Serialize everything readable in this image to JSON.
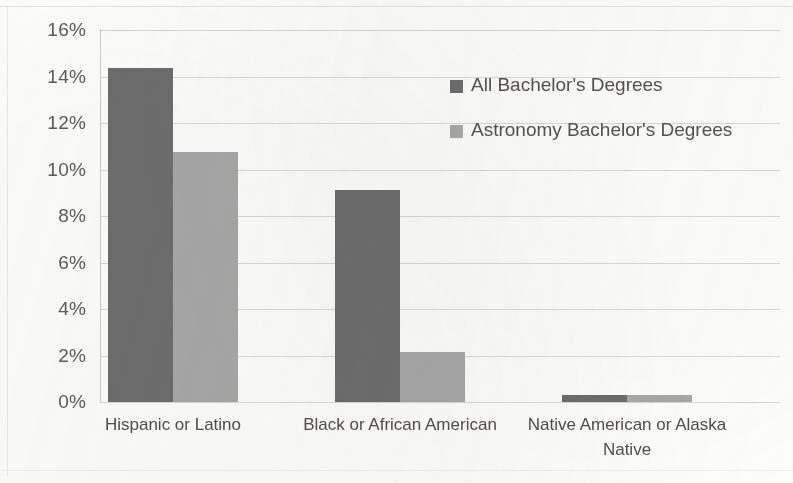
{
  "chart_data": {
    "type": "bar",
    "title": "",
    "subtitle": "",
    "xlabel": "",
    "ylabel": "",
    "categories": [
      "Hispanic or Latino",
      "Black or African American",
      "Native American or Alaska Native"
    ],
    "series": [
      {
        "name": "All Bachelor's Degrees",
        "color": "#6e6e6e",
        "values": [
          14.35,
          9.1,
          0.3
        ]
      },
      {
        "name": "Astronomy Bachelor's Degrees",
        "color": "#a8a8a8",
        "values": [
          10.75,
          2.15,
          0.3
        ]
      }
    ],
    "ylim": [
      0,
      16
    ],
    "ytick_values": [
      0,
      2,
      4,
      6,
      8,
      10,
      12,
      14,
      16
    ],
    "ytick_labels": [
      "0%",
      "2%",
      "4%",
      "6%",
      "8%",
      "10%",
      "12%",
      "14%",
      "16%"
    ],
    "value_format": "percent",
    "grid": "horizontal",
    "legend_position": "inside-top-right",
    "axis_color": "#cdcbc7",
    "gridline_color": "#d9d7d3",
    "background_color": "#fdfdfc"
  },
  "legend": {
    "items": [
      {
        "label": "All Bachelor's Degrees",
        "color": "#6e6e6e"
      },
      {
        "label": "Astronomy Bachelor's Degrees",
        "color": "#a8a8a8"
      }
    ]
  }
}
